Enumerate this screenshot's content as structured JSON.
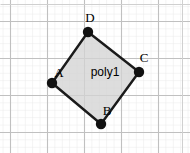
{
  "app": {
    "name": "geometry-applet",
    "width": 190,
    "height": 153,
    "background_color": "#ffffff"
  },
  "grid": {
    "minor_spacing_px": 7.4,
    "major_spacing_px": 37,
    "minor_color": "#e8e8e8",
    "major_color": "#bfbfbf",
    "border_color": "#cfcfcf",
    "visible": true,
    "major_x": [
      10,
      47,
      84,
      121,
      158
    ],
    "major_y": [
      21,
      58,
      95,
      132
    ]
  },
  "chart_data": {
    "type": "scatter",
    "title": "",
    "xlabel": "",
    "ylabel": "",
    "grid": true,
    "legend": "none",
    "xlim": [
      0,
      190
    ],
    "ylim": [
      153,
      0
    ],
    "annotations": [
      "poly1"
    ],
    "series": [
      {
        "name": "poly1",
        "kind": "polygon",
        "fill": "#d4d4d4",
        "fill_opacity": 0.75,
        "stroke": "#1a1a1a",
        "stroke_width": 2.4,
        "points": [
          {
            "label": "A",
            "x": 52,
            "y": 83
          },
          {
            "label": "B",
            "x": 101,
            "y": 124
          },
          {
            "label": "C",
            "x": 139,
            "y": 72
          },
          {
            "label": "D",
            "x": 88,
            "y": 32
          }
        ]
      }
    ]
  },
  "shape": {
    "id": "poly1",
    "label": "poly1",
    "label_x": 105,
    "label_y": 76,
    "fill_color": "#d4d4d4",
    "stroke_color": "#1a1a1a",
    "vertices": [
      {
        "name": "A",
        "x": 52,
        "y": 83,
        "label_dx": 7,
        "label_dy": -6,
        "dot_radius": 5.2,
        "color": "#111111"
      },
      {
        "name": "B",
        "x": 101,
        "y": 124,
        "label_dx": 6,
        "label_dy": -9,
        "dot_radius": 5.2,
        "color": "#111111"
      },
      {
        "name": "C",
        "x": 139,
        "y": 72,
        "label_dx": 5,
        "label_dy": -10,
        "dot_radius": 5.2,
        "color": "#111111"
      },
      {
        "name": "D",
        "x": 88,
        "y": 32,
        "label_dx": 2,
        "label_dy": -10,
        "dot_radius": 5.2,
        "color": "#111111"
      }
    ]
  }
}
